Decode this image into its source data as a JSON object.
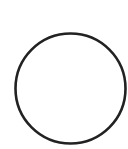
{
  "canvas": {
    "width": 128,
    "height": 149,
    "background": "#ffffff"
  },
  "shape": {
    "type": "circle-outline",
    "icon": "circle-icon",
    "cx": 70.5,
    "cy": 88.5,
    "r": 55,
    "stroke": "#222222",
    "stroke_width": 2.6,
    "fill": "none"
  }
}
